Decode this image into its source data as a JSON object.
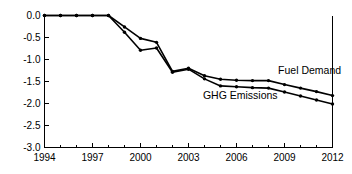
{
  "chart_data": {
    "type": "line",
    "title": "",
    "xlabel": "",
    "ylabel": "",
    "xlim": [
      1994,
      2012
    ],
    "ylim": [
      -3.0,
      0.0
    ],
    "grid": false,
    "legend_position": "inline-annotation",
    "x": [
      1994,
      1995,
      1996,
      1997,
      1998,
      1999,
      2000,
      2001,
      2002,
      2003,
      2004,
      2005,
      2006,
      2007,
      2008,
      2009,
      2010,
      2011,
      2012
    ],
    "xticks": [
      1994,
      1997,
      2000,
      2003,
      2006,
      2009,
      2012
    ],
    "xtick_labels": [
      "1994",
      "1997",
      "2000",
      "2003",
      "2006",
      "2009",
      "2012"
    ],
    "yticks": [
      0.0,
      -0.5,
      -1.0,
      -1.5,
      -2.0,
      -2.5,
      -3.0
    ],
    "ytick_labels": [
      "0.0",
      "-0.5",
      "-1.0",
      "-1.5",
      "-2.0",
      "-2.5",
      "-3.0"
    ],
    "series": [
      {
        "name": "Fuel Demand",
        "color": "#000000",
        "marker": "circle",
        "values": [
          0.0,
          0.0,
          0.0,
          0.0,
          0.0,
          -0.26,
          -0.52,
          -0.61,
          -1.27,
          -1.2,
          -1.37,
          -1.45,
          -1.47,
          -1.48,
          -1.48,
          -1.57,
          -1.65,
          -1.73,
          -1.82
        ]
      },
      {
        "name": "GHG Emissions",
        "color": "#000000",
        "marker": "circle",
        "values": [
          0.0,
          0.0,
          0.0,
          0.0,
          0.0,
          -0.38,
          -0.79,
          -0.74,
          -1.29,
          -1.22,
          -1.44,
          -1.6,
          -1.62,
          -1.64,
          -1.65,
          -1.74,
          -1.83,
          -1.92,
          -2.01
        ]
      }
    ],
    "annotations": [
      {
        "text": "Fuel Demand",
        "x": 2008.6,
        "y": -1.32
      },
      {
        "text": "GHG Emissions",
        "x": 2003.9,
        "y": -1.89
      }
    ]
  }
}
